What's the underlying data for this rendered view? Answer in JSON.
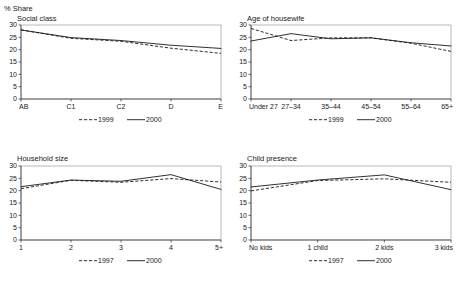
{
  "figure": {
    "unit_label": "% Share",
    "axis_color": "#2b2b2b",
    "line_color": "#1a1a1a",
    "background": "#ffffff"
  },
  "chart_data": [
    {
      "type": "line",
      "title": "Social class",
      "panel": "top-left",
      "xlabel": "",
      "ylabel": "% Share",
      "ylim": [
        0,
        30
      ],
      "yticks": [
        0,
        5,
        10,
        15,
        20,
        25,
        30
      ],
      "grid": false,
      "legend_position": "bottom",
      "categories": [
        "AB",
        "C1",
        "C2",
        "D",
        "E"
      ],
      "series": [
        {
          "name": "1999",
          "style": "dashed",
          "values": [
            28.0,
            24.6,
            23.4,
            20.6,
            18.5
          ]
        },
        {
          "name": "2000",
          "style": "solid",
          "values": [
            28.0,
            24.9,
            23.7,
            21.8,
            20.5
          ]
        }
      ]
    },
    {
      "type": "line",
      "title": "Age of housewife",
      "panel": "top-right",
      "xlabel": "",
      "ylabel": "% Share",
      "ylim": [
        0,
        30
      ],
      "yticks": [
        0,
        5,
        10,
        15,
        20,
        25,
        30
      ],
      "grid": false,
      "legend_position": "bottom",
      "categories": [
        "Under 27",
        "27–34",
        "35–44",
        "45–54",
        "55–64",
        "65+"
      ],
      "series": [
        {
          "name": "1999",
          "style": "dashed",
          "values": [
            28.6,
            23.7,
            24.8,
            24.8,
            22.6,
            19.3
          ]
        },
        {
          "name": "2000",
          "style": "solid",
          "values": [
            23.5,
            26.5,
            24.4,
            24.8,
            22.8,
            21.5
          ]
        }
      ]
    },
    {
      "type": "line",
      "title": "Household size",
      "panel": "bottom-left",
      "xlabel": "",
      "ylabel": "% Share",
      "ylim": [
        0,
        30
      ],
      "yticks": [
        0,
        5,
        10,
        15,
        20,
        25,
        30
      ],
      "grid": false,
      "legend_position": "bottom",
      "categories": [
        "1",
        "2",
        "3",
        "4",
        "5+"
      ],
      "series": [
        {
          "name": "1997",
          "style": "dashed",
          "values": [
            20.8,
            24.2,
            23.4,
            24.9,
            23.5
          ]
        },
        {
          "name": "2000",
          "style": "solid",
          "values": [
            21.6,
            24.3,
            23.8,
            26.5,
            20.5
          ]
        }
      ]
    },
    {
      "type": "line",
      "title": "Child presence",
      "panel": "bottom-right",
      "xlabel": "",
      "ylabel": "% Share",
      "ylim": [
        0,
        30
      ],
      "yticks": [
        0,
        5,
        10,
        15,
        20,
        25,
        30
      ],
      "grid": false,
      "legend_position": "bottom",
      "categories": [
        "No kids",
        "1 child",
        "2 kids",
        "3 kids"
      ],
      "series": [
        {
          "name": "1997",
          "style": "dashed",
          "values": [
            19.9,
            24.1,
            24.8,
            23.4
          ]
        },
        {
          "name": "2000",
          "style": "solid",
          "values": [
            21.5,
            24.3,
            26.4,
            20.4
          ]
        }
      ]
    }
  ]
}
